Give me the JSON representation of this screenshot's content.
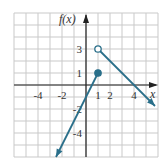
{
  "chart_data": {
    "type": "line",
    "title": "",
    "xlabel": "x",
    "ylabel": "f(x)",
    "xlim": [
      -6,
      6
    ],
    "ylim": [
      -6,
      6
    ],
    "grid": true,
    "x_ticks": [
      {
        "value": -4,
        "label": "-4"
      },
      {
        "value": -2,
        "label": "-2"
      },
      {
        "value": 1,
        "label": "1"
      },
      {
        "value": 2,
        "label": "2"
      },
      {
        "value": 4,
        "label": "4"
      }
    ],
    "y_ticks": [
      {
        "value": 3,
        "label": "3"
      },
      {
        "value": 1,
        "label": "1"
      },
      {
        "value": -2,
        "label": "-2"
      },
      {
        "value": -4,
        "label": "-4"
      }
    ],
    "series": [
      {
        "name": "f(x) = 2x - 1, x <= 1",
        "x": [
          -2.5,
          1
        ],
        "y": [
          -6,
          1
        ],
        "start_marker": "arrow",
        "end_marker": "closed-dot"
      },
      {
        "name": "f(x) = -x + 4, x > 1",
        "x": [
          1,
          5.75
        ],
        "y": [
          3,
          -1.75
        ],
        "start_marker": "open-dot",
        "end_marker": "arrow"
      }
    ],
    "points": [
      {
        "x": 1,
        "y": 1,
        "style": "closed"
      },
      {
        "x": 1,
        "y": 3,
        "style": "open"
      }
    ]
  },
  "colors": {
    "line": "#2a6f8a",
    "grid": "#c9c9c9",
    "axis": "#222222",
    "background": "#ffffff"
  },
  "labels": {
    "y_axis": "f(x)",
    "x_axis": "x"
  }
}
